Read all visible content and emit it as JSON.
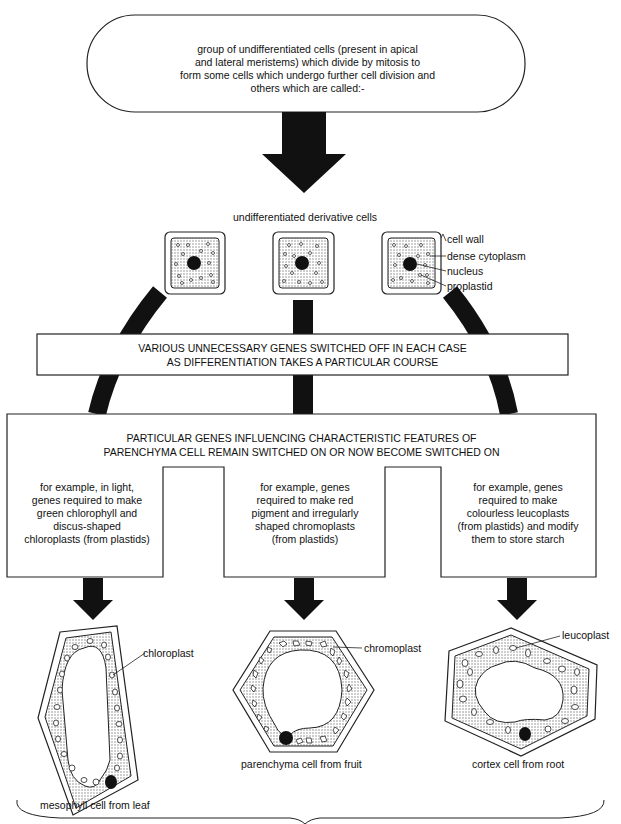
{
  "top_box": {
    "lines": [
      "group of undifferentiated cells (present in apical",
      "and lateral meristems) which divide by mitosis to",
      "form some cells which undergo further cell division and",
      "others which are called:-"
    ]
  },
  "derivative_cells": {
    "heading": "undifferentiated derivative cells",
    "labels": {
      "cell_wall": "cell wall",
      "dense_cytoplasm": "dense cytoplasm",
      "nucleus": "nucleus",
      "proplastid": "proplastid"
    }
  },
  "genes_off_box": {
    "lines": [
      "VARIOUS UNNECESSARY GENES SWITCHED OFF IN EACH CASE",
      "AS DIFFERENTIATION TAKES A PARTICULAR COURSE"
    ]
  },
  "genes_on_box": {
    "lines": [
      "PARTICULAR GENES INFLUENCING  CHARACTERISTIC FEATURES OF",
      "PARENCHYMA CELL REMAIN SWITCHED ON OR NOW BECOME SWITCHED ON"
    ],
    "columns": [
      {
        "lines": [
          "for example, in light,",
          "genes required to make",
          "green chlorophyll and",
          "discus-shaped",
          "chloroplasts (from plastids)"
        ]
      },
      {
        "lines": [
          "for example, genes",
          "required to make red",
          "pigment and irregularly",
          "shaped chromoplasts",
          "(from plastids)"
        ]
      },
      {
        "lines": [
          "for example, genes",
          "required to make",
          "colourless leucoplasts",
          "(from plastids) and modify",
          "them to store starch"
        ]
      }
    ]
  },
  "result_cells": [
    {
      "organelle_label": "chloroplast",
      "caption": "mesophyll cell from leaf"
    },
    {
      "organelle_label": "chromoplast",
      "caption": "parenchyma cell from fruit"
    },
    {
      "organelle_label": "leucoplast",
      "caption": "cortex cell from root"
    }
  ]
}
